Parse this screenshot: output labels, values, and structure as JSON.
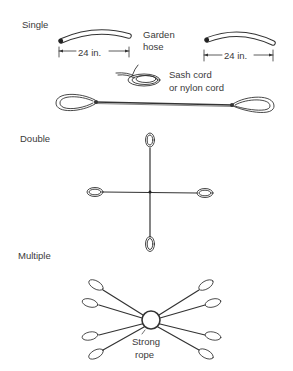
{
  "sections": {
    "single": {
      "title": "Single",
      "hose_label_line1": "Garden",
      "hose_label_line2": "hose",
      "length_left": "24 in.",
      "length_right": "24 in.",
      "cord_label_line1": "Sash cord",
      "cord_label_line2": "or nylon cord"
    },
    "double": {
      "title": "Double"
    },
    "multiple": {
      "title": "Multiple",
      "center_label_line1": "Strong",
      "center_label_line2": "rope"
    }
  },
  "colors": {
    "ink": "#333333",
    "background": "#ffffff"
  }
}
